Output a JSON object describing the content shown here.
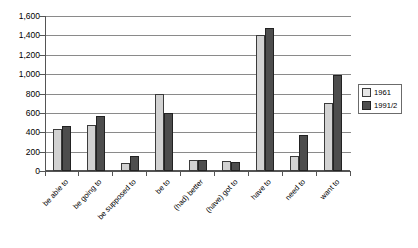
{
  "chart_data": {
    "type": "bar",
    "title": "",
    "xlabel": "",
    "ylabel": "",
    "ylim": [
      0,
      1600
    ],
    "ytick_step": 200,
    "grid": true,
    "legend_position": "right",
    "ytick_labels": [
      "1,600",
      "1,400",
      "1,200",
      "1,000",
      "800",
      "600",
      "400",
      "200",
      "0"
    ],
    "ytick_values": [
      1600,
      1400,
      1200,
      1000,
      800,
      600,
      400,
      200,
      0
    ],
    "categories": [
      "be able to",
      "be going to",
      "be supposed to",
      "be to",
      "(had) better",
      "(have) got to",
      "have to",
      "need to",
      "want to"
    ],
    "series": [
      {
        "name": "1961",
        "color": "#d2d2d2",
        "values": [
          430,
          480,
          80,
          800,
          110,
          100,
          1400,
          150,
          700
        ]
      },
      {
        "name": "1991/2",
        "color": "#4d4d4d",
        "values": [
          460,
          570,
          150,
          600,
          110,
          95,
          1480,
          370,
          990
        ]
      }
    ]
  }
}
